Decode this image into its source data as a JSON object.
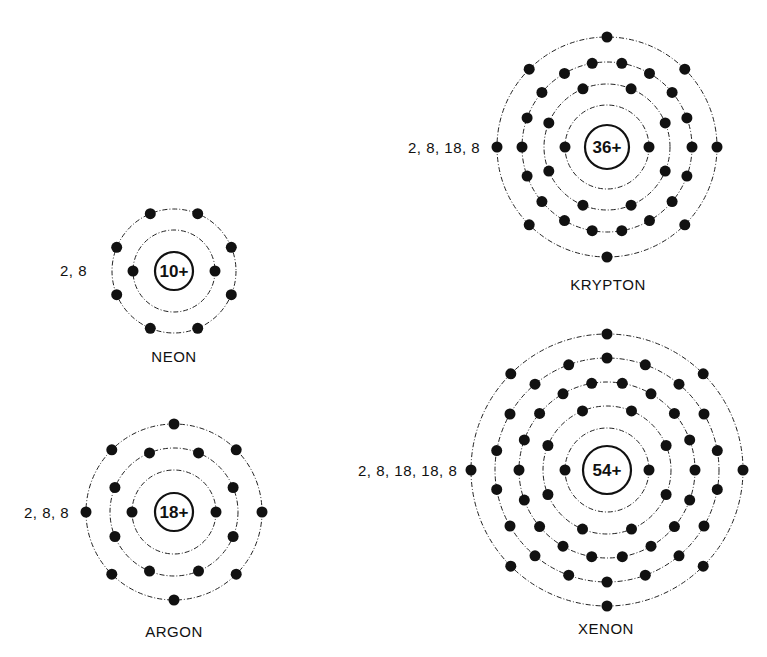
{
  "atoms": [
    {
      "id": "neon",
      "name": "NEON",
      "nucleus_label": "10+",
      "configuration": "2, 8",
      "shells": [
        2,
        8
      ],
      "center": [
        174,
        271
      ],
      "nucleus_r": 19,
      "shell_radii": [
        41,
        62
      ],
      "shell_offsets_deg": [
        0,
        22.5
      ],
      "config_pos": [
        60,
        276
      ],
      "name_pos": [
        174,
        362
      ]
    },
    {
      "id": "argon",
      "name": "ARGON",
      "nucleus_label": "18+",
      "configuration": "2, 8, 8",
      "shells": [
        2,
        8,
        8
      ],
      "center": [
        174,
        512
      ],
      "nucleus_r": 19,
      "shell_radii": [
        42,
        64,
        88
      ],
      "shell_offsets_deg": [
        0,
        22.5,
        0
      ],
      "config_pos": [
        24,
        518
      ],
      "name_pos": [
        174,
        637
      ]
    },
    {
      "id": "krypton",
      "name": "KRYPTON",
      "nucleus_label": "36+",
      "configuration": "2, 8, 18, 8",
      "shells": [
        2,
        8,
        18,
        8
      ],
      "center": [
        607,
        147
      ],
      "nucleus_r": 22,
      "shell_radii": [
        42,
        63,
        85,
        110
      ],
      "shell_offsets_deg": [
        0,
        22.5,
        10,
        0
      ],
      "config_pos": [
        408,
        153
      ],
      "name_pos": [
        608,
        290
      ]
    },
    {
      "id": "xenon",
      "name": "XENON",
      "nucleus_label": "54+",
      "configuration": "2, 8, 18, 18, 8",
      "shells": [
        2,
        8,
        18,
        18,
        8
      ],
      "center": [
        607,
        470
      ],
      "nucleus_r": 24,
      "shell_radii": [
        42,
        64,
        88,
        112,
        136
      ],
      "shell_offsets_deg": [
        0,
        22.5,
        10,
        0,
        0
      ],
      "config_pos": [
        358,
        476
      ],
      "name_pos": [
        606,
        634
      ]
    }
  ]
}
